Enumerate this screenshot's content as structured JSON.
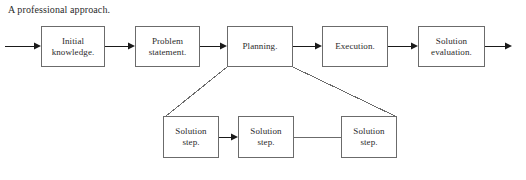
{
  "diagram": {
    "title": "A professional approach.",
    "background_color": "#ffffff",
    "line_color": "#6b6b6b",
    "arrow_color": "#1a1a1a",
    "text_color": "#2b2b2b",
    "top_row": [
      {
        "id": "initial-knowledge",
        "label": "Initial\nknowledge.",
        "x": 41,
        "y": 26,
        "w": 64,
        "h": 41
      },
      {
        "id": "problem-statement",
        "label": "Problem\nstatement.",
        "x": 135,
        "y": 26,
        "w": 65,
        "h": 41
      },
      {
        "id": "planning",
        "label": "Planning.",
        "x": 227,
        "y": 26,
        "w": 66,
        "h": 41
      },
      {
        "id": "execution",
        "label": "Execution.",
        "x": 322,
        "y": 26,
        "w": 66,
        "h": 41
      },
      {
        "id": "solution-evaluation",
        "label": "Solution\nevaluation.",
        "x": 418,
        "y": 26,
        "w": 67,
        "h": 41
      }
    ],
    "bottom_row": [
      {
        "id": "solution-step-1",
        "label": "Solution\nstep.",
        "x": 163,
        "y": 116,
        "w": 56,
        "h": 42
      },
      {
        "id": "solution-step-2",
        "label": "Solution\nstep.",
        "x": 238,
        "y": 116,
        "w": 56,
        "h": 42
      },
      {
        "id": "solution-step-3",
        "label": "Solution\nstep.",
        "x": 341,
        "y": 116,
        "w": 56,
        "h": 42
      }
    ],
    "connectors": [
      {
        "id": "entry-arrow",
        "kind": "arrow",
        "from": [
          5,
          46
        ],
        "to": [
          41,
          46
        ]
      },
      {
        "id": "initial-to-problem",
        "kind": "arrow",
        "from": [
          105,
          46
        ],
        "to": [
          135,
          46
        ]
      },
      {
        "id": "problem-to-planning",
        "kind": "arrow",
        "from": [
          200,
          46
        ],
        "to": [
          227,
          46
        ]
      },
      {
        "id": "planning-to-execution",
        "kind": "arrow",
        "from": [
          293,
          46
        ],
        "to": [
          322,
          46
        ]
      },
      {
        "id": "execution-to-evaluation",
        "kind": "arrow",
        "from": [
          388,
          46
        ],
        "to": [
          418,
          46
        ]
      },
      {
        "id": "exit-arrow",
        "kind": "arrow",
        "from": [
          485,
          46
        ],
        "to": [
          512,
          46
        ]
      },
      {
        "id": "planning-to-step1",
        "kind": "line",
        "from": [
          227,
          67
        ],
        "to": [
          166,
          116
        ]
      },
      {
        "id": "planning-to-step3",
        "kind": "line",
        "from": [
          293,
          67
        ],
        "to": [
          395,
          116
        ]
      },
      {
        "id": "step1-to-step2",
        "kind": "arrow",
        "from": [
          219,
          137
        ],
        "to": [
          238,
          137
        ]
      },
      {
        "id": "step2-to-step3",
        "kind": "line",
        "from": [
          294,
          137
        ],
        "to": [
          341,
          137
        ]
      }
    ]
  }
}
